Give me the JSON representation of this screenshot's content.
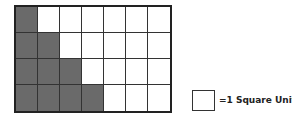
{
  "diagram": {
    "grid": {
      "rows": 4,
      "cols": 7,
      "shaded": [
        [
          1,
          0,
          0,
          0,
          0,
          0,
          0
        ],
        [
          1,
          1,
          0,
          0,
          0,
          0,
          0
        ],
        [
          1,
          1,
          1,
          0,
          0,
          0,
          0
        ],
        [
          1,
          1,
          1,
          1,
          0,
          0,
          0
        ]
      ],
      "shaded_color": "#6a6a6a",
      "shaded_count": 10
    },
    "legend": {
      "label": "=1 Square Unit"
    }
  }
}
